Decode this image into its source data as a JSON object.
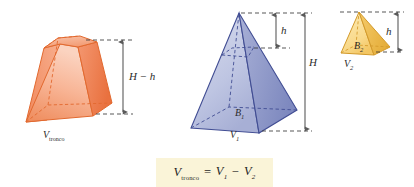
{
  "figure": {
    "caption_formula": {
      "lhs_symbol": "V",
      "lhs_subscript": "tronco",
      "equals": "=",
      "term1_symbol": "V",
      "term1_subscript": "1",
      "minus": "−",
      "term2_symbol": "V",
      "term2_subscript": "2",
      "full_text": "V tronco = V1 − V2"
    },
    "shapes": [
      {
        "id": "frustum",
        "name": "truncated-pyramid-frustum",
        "color": "#F08050",
        "fill_light": "#FBC6AC",
        "fill_dark": "#F2926A",
        "volume_label_symbol": "V",
        "volume_label_subscript": "tronco",
        "dimension_label": "H − h"
      },
      {
        "id": "pyramid-large",
        "name": "large-pyramid",
        "color": "#4A5BA6",
        "fill_light": "#C9CEE8",
        "fill_dark": "#8E97C8",
        "volume_label_symbol": "V",
        "volume_label_subscript": "1",
        "base_label_symbol": "B",
        "base_label_subscript": "1",
        "dimension_label_top": "h",
        "dimension_label_full": "H"
      },
      {
        "id": "pyramid-small",
        "name": "small-pyramid",
        "color": "#E0A83C",
        "fill_light": "#FBE09B",
        "fill_dark": "#F2C75C",
        "volume_label_symbol": "V",
        "volume_label_subscript": "2",
        "base_label_symbol": "B",
        "base_label_subscript": "2",
        "dimension_label": "h"
      }
    ],
    "labels": {
      "frustum_height": "H − h",
      "frustum_volume_sym": "V",
      "frustum_volume_sub": "tronco",
      "pyramid1_volume_sym": "V",
      "pyramid1_volume_sub": "1",
      "pyramid1_base_sym": "B",
      "pyramid1_base_sub": "1",
      "pyramid1_h": "h",
      "pyramid1_H": "H",
      "pyramid2_volume_sym": "V",
      "pyramid2_volume_sub": "2",
      "pyramid2_base_sym": "B",
      "pyramid2_base_sub": "2",
      "pyramid2_h": "h"
    },
    "colors": {
      "dash_line": "#3a3a3a",
      "arrow_line": "#6b6b6b",
      "formula_background": "#faf4d8",
      "page_background": "#ffffff"
    }
  }
}
